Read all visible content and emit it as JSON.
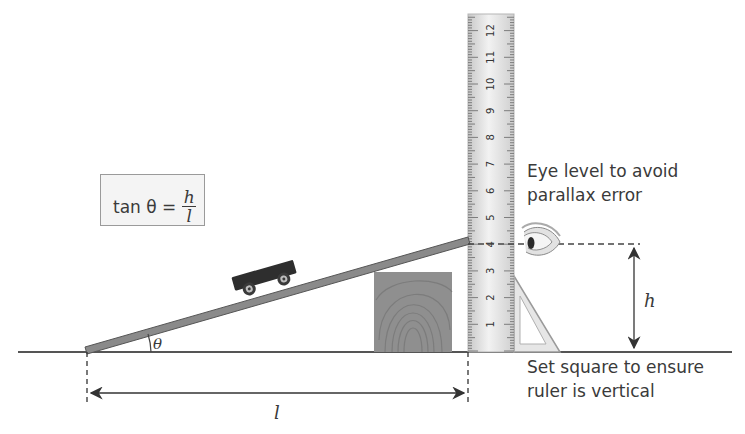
{
  "formula": {
    "prefix": "tan θ =",
    "numerator": "h",
    "denominator": "l"
  },
  "labels": {
    "theta": "θ",
    "height": "h",
    "length": "l",
    "eye_level_line1": "Eye level to avoid",
    "eye_level_line2": "parallax error",
    "set_square_line1": "Set square to ensure",
    "set_square_line2": "ruler is vertical"
  },
  "ruler": {
    "tick_labels": [
      "1",
      "2",
      "3",
      "4",
      "5",
      "6",
      "7",
      "8",
      "9",
      "10",
      "11",
      "12"
    ],
    "reading_at_ramp_top": "4"
  },
  "colors": {
    "ramp": "#7a7a7a",
    "trolley": "#2e2e2e",
    "block": "#8c8c8c",
    "ruler": "#e4e4e4",
    "ground": "#555555"
  }
}
